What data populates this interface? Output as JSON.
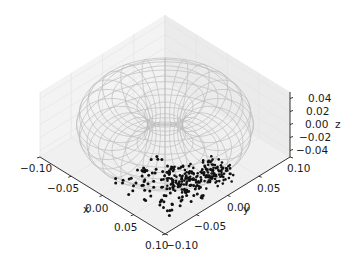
{
  "chart_data": {
    "type": "scatter3d",
    "title": "",
    "xlabel": "x",
    "ylabel": "y",
    "zlabel": "z",
    "xlim": [
      -0.1,
      0.1
    ],
    "ylim": [
      -0.1,
      0.1
    ],
    "zlim": [
      -0.05,
      0.05
    ],
    "x_ticks": [
      "-0.10",
      "-0.05",
      "0.00",
      "0.05",
      "0.10"
    ],
    "y_ticks": [
      "-0.10",
      "-0.05",
      "0.00",
      "0.05",
      "0.10"
    ],
    "z_ticks": [
      "-0.04",
      "-0.02",
      "0.00",
      "0.02",
      "0.04"
    ],
    "grid": true,
    "legend": null,
    "surface": {
      "kind": "torus-wireframe",
      "color": "#c0c0c0",
      "major_radius": 0.06,
      "minor_radius": 0.04,
      "description": "Light gray wireframe torus centered at origin"
    },
    "scatter": {
      "color": "#111111",
      "description": "Cluster of black points inside lower front of torus, roughly x in [0.0,0.08], y in [-0.07,0.03], z near -0.03",
      "approx_count": 300
    }
  },
  "colors": {
    "pane": "#f2f2f2",
    "grid": "#e0e0e0",
    "wire": "#bdbdbd",
    "axis": "#222222",
    "points": "#111111"
  }
}
